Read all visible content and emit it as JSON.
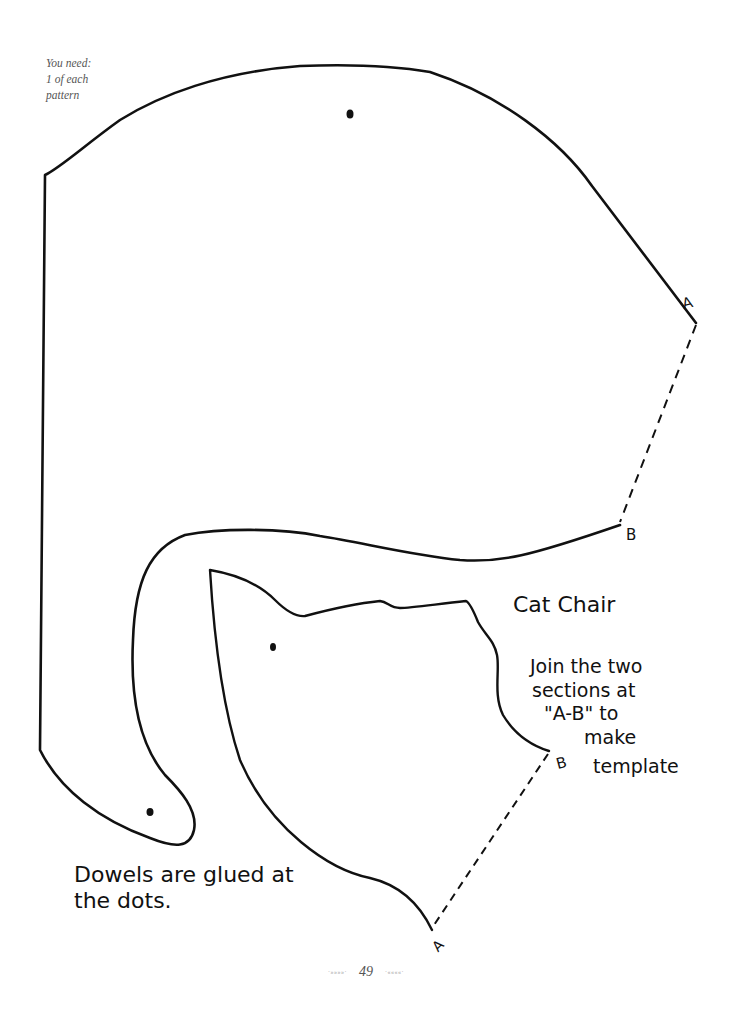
{
  "note": {
    "lines": [
      "You need:",
      "1 of each",
      "pattern"
    ]
  },
  "pattern_large": {
    "label_a": "A",
    "label_b": "B"
  },
  "pattern_small": {
    "label_a": "A",
    "label_b": "B"
  },
  "title": "Cat Chair",
  "instructions": {
    "lines": [
      "Join the two",
      "sections at",
      "\"A-B\" to",
      "make",
      "template"
    ]
  },
  "dowel_note": {
    "lines": [
      "Dowels are glued at",
      "the dots."
    ]
  },
  "footer": {
    "left_ornament": "·»»»»·",
    "page_number": "49",
    "right_ornament": "·««««·"
  },
  "colors": {
    "line": "#111111",
    "background": "#ffffff",
    "note_text": "#555555"
  }
}
